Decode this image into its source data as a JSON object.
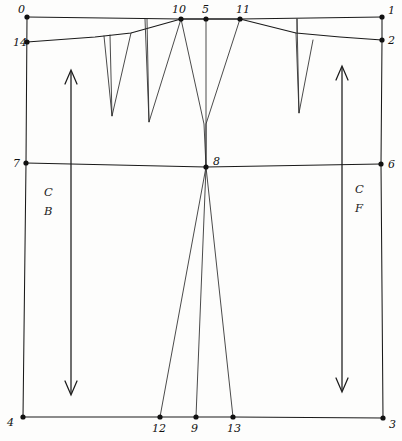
{
  "drawing": {
    "title": "Bodice block pattern draft",
    "canvas": {
      "width": 402,
      "height": 441
    },
    "ink_color": "#1a1a1a",
    "paper_color": "#fdfdfc"
  },
  "points": [
    {
      "id": "0",
      "label": "0",
      "x": 27,
      "y": 17,
      "label_x": 18,
      "label_y": 13
    },
    {
      "id": "1",
      "label": "1",
      "x": 382,
      "y": 17,
      "label_x": 388,
      "label_y": 14
    },
    {
      "id": "2",
      "label": "2",
      "x": 382,
      "y": 40,
      "label_x": 388,
      "label_y": 44
    },
    {
      "id": "3",
      "label": "3",
      "x": 383,
      "y": 418,
      "label_x": 389,
      "label_y": 428
    },
    {
      "id": "4",
      "label": "4",
      "x": 23,
      "y": 417,
      "label_x": 7,
      "label_y": 426
    },
    {
      "id": "5",
      "label": "5",
      "x": 206,
      "y": 19,
      "label_x": 202,
      "label_y": 13
    },
    {
      "id": "6",
      "label": "6",
      "x": 381,
      "y": 164,
      "label_x": 388,
      "label_y": 168
    },
    {
      "id": "7",
      "label": "7",
      "x": 26,
      "y": 163,
      "label_x": 13,
      "label_y": 167
    },
    {
      "id": "8",
      "label": "8",
      "x": 206,
      "y": 167,
      "label_x": 213,
      "label_y": 165
    },
    {
      "id": "9",
      "label": "9",
      "x": 196,
      "y": 417,
      "label_x": 191,
      "label_y": 432
    },
    {
      "id": "10",
      "label": "10",
      "x": 181,
      "y": 19,
      "label_x": 172,
      "label_y": 13
    },
    {
      "id": "11",
      "label": "11",
      "x": 240,
      "y": 19,
      "label_x": 236,
      "label_y": 13
    },
    {
      "id": "12",
      "label": "12",
      "x": 160,
      "y": 417,
      "label_x": 152,
      "label_y": 432
    },
    {
      "id": "13",
      "label": "13",
      "x": 233,
      "y": 417,
      "label_x": 227,
      "label_y": 432
    },
    {
      "id": "14",
      "label": "14",
      "x": 27,
      "y": 42,
      "label_x": 13,
      "label_y": 46
    }
  ],
  "zone_labels": [
    {
      "id": "center-back",
      "line1": "C",
      "line2": "B",
      "x": 44,
      "y": 196
    },
    {
      "id": "center-front",
      "line1": "C",
      "line2": "F",
      "x": 355,
      "y": 193
    }
  ],
  "paths": {
    "top_shoulder_line": "M 27,17 L 181,19 L 206,19 L 240,19 L 382,17",
    "neck_line": "M 27,42 L 95,37 L 104,36 L 131,33 L 181,19",
    "upper_chest_line": "M 181,19 L 240,19 L 296,33 L 340,37 L 382,40",
    "left_edge": "M 27,17 L 26,163 L 23,417",
    "right_edge": "M 382,17 L 382,40 L 381,164 L 383,418",
    "bust_line": "M 26,163 L 206,167 L 381,164",
    "hem_line": "M 23,417 L 160,417 L 196,417 L 233,417 L 383,418",
    "dart_left_outer": "M 104,36 L 112,116 L 131,33",
    "dart_left_inner": "M 110,35 L 112,116",
    "dart_mid_vertical": "M 145,19 L 149,122 L 181,19",
    "dart_mid_short": "M 147,19 L 149,122",
    "dart_right_outer": "M 296,33 L 299,113 L 313,40",
    "dart_right_inner": "M 297,19 L 299,113",
    "dart_right_stem": "M 297,19 L 297,33",
    "princess_back": "M 181,19 L 204,124 L 206,167 L 160,417",
    "princess_front": "M 240,19 L 206,124 L 206,167 L 233,417",
    "center_vertical": "M 206,19 L 206,167 L 196,417"
  },
  "grain_lines": [
    {
      "id": "grain-line-back",
      "shaft": "M 71,72 L 71,393",
      "arrow_top": "M 65,84 L 71,70 L 77,84",
      "arrow_bottom": "M 65,381 L 71,395 L 77,381"
    },
    {
      "id": "grain-line-front",
      "shaft": "M 342,68 L 342,390",
      "arrow_top": "M 336,80 L 342,66 L 348,80",
      "arrow_bottom": "M 336,378 L 342,392 L 348,378"
    }
  ]
}
